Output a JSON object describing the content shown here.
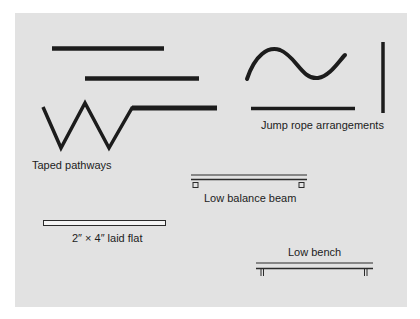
{
  "figure": {
    "background_color": "#e2e2e2",
    "stroke_color": "#1c1c1c",
    "groups": [
      {
        "id": "taped-pathways",
        "label": "Taped pathways",
        "shapes": [
          "straight line",
          "straight line (offset)",
          "zigzag line ending in straight segment"
        ]
      },
      {
        "id": "jump-rope-arrangements",
        "label": "Jump rope arrangements",
        "shapes": [
          "wavy curve",
          "horizontal line",
          "vertical line"
        ]
      },
      {
        "id": "low-balance-beam",
        "label": "Low balance beam",
        "shapes": [
          "beam with two small square supports"
        ]
      },
      {
        "id": "two-by-four",
        "label": "2″ × 4″ laid flat",
        "shapes": [
          "flat board rectangle"
        ]
      },
      {
        "id": "low-bench",
        "label": "Low bench",
        "shapes": [
          "bench top with two legs"
        ]
      }
    ]
  },
  "labels": {
    "taped": "Taped pathways",
    "jump": "Jump rope arrangements",
    "beam": "Low balance beam",
    "flat": "2″ × 4″ laid flat",
    "bench": "Low bench"
  }
}
